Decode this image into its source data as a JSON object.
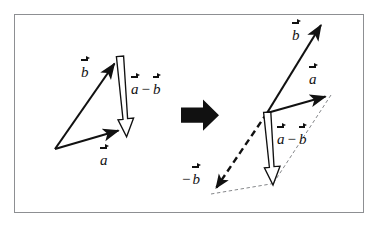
{
  "figure": {
    "frame": {
      "x": 14,
      "y": 14,
      "width": 350,
      "height": 199,
      "border_color": "#8d8f92",
      "background": "#ffffff"
    },
    "stroke_color": "#111111",
    "hollow_fill": "#ffffff",
    "panels": [
      {
        "name": "left-panel",
        "caption": "Triangle construction: a - b drawn from tip of b to tip of a",
        "origin": {
          "x": 55,
          "y": 149
        },
        "vectors": [
          {
            "name": "vector-b",
            "label": "b",
            "style": "solid-thin",
            "from": {
              "x": 55,
              "y": 149
            },
            "to": {
              "x": 119,
              "y": 58
            },
            "label_pos": {
              "x": 81,
              "y": 63
            }
          },
          {
            "name": "vector-a",
            "label": "a",
            "style": "solid-thin",
            "from": {
              "x": 55,
              "y": 149
            },
            "to": {
              "x": 124,
              "y": 129
            },
            "label_pos": {
              "x": 100,
              "y": 151
            }
          },
          {
            "name": "vector-a-minus-b",
            "label_first": "a",
            "label_op": "−",
            "label_second": "b",
            "style": "hollow-outline",
            "from": {
              "x": 120,
              "y": 57
            },
            "to": {
              "x": 127,
              "y": 136
            },
            "label_pos": {
              "x": 131,
              "y": 80
            }
          }
        ]
      },
      {
        "name": "transform-arrow",
        "icon": "right-arrow-icon",
        "x": 181,
        "y": 99,
        "width": 38,
        "height": 32
      },
      {
        "name": "right-panel",
        "caption": "Parallelogram construction: a - b equals a plus (minus b)",
        "origin": {
          "x": 267,
          "y": 113
        },
        "vectors": [
          {
            "name": "vector-b",
            "label": "b",
            "style": "solid-thin",
            "from": {
              "x": 267,
              "y": 113
            },
            "to": {
              "x": 326,
              "y": 19
            },
            "label_pos": {
              "x": 292,
              "y": 26
            }
          },
          {
            "name": "vector-a",
            "label": "a",
            "style": "solid-thin",
            "from": {
              "x": 267,
              "y": 113
            },
            "to": {
              "x": 331,
              "y": 95
            },
            "label_pos": {
              "x": 309,
              "y": 70
            }
          },
          {
            "name": "vector-minus-b",
            "label_lead": "−",
            "label": "b",
            "style": "dashed-bold",
            "from": {
              "x": 267,
              "y": 113
            },
            "to": {
              "x": 213,
              "y": 193
            },
            "label_pos": {
              "x": 182,
              "y": 170
            }
          },
          {
            "name": "vector-a-minus-b",
            "label_first": "a",
            "label_op": "−",
            "label_second": "b",
            "style": "hollow-outline",
            "from": {
              "x": 266,
              "y": 113
            },
            "to": {
              "x": 273,
              "y": 184
            },
            "label_pos": {
              "x": 277,
              "y": 130
            }
          }
        ],
        "guide_lines": [
          {
            "name": "guide-a-to-resultant",
            "style": "dashed-thin",
            "from": {
              "x": 331,
              "y": 95
            },
            "to": {
              "x": 272,
              "y": 184
            }
          },
          {
            "name": "guide-minusb-to-resultant",
            "style": "dashed-thin",
            "from": {
              "x": 213,
              "y": 193
            },
            "to": {
              "x": 272,
              "y": 184
            }
          }
        ]
      }
    ]
  }
}
